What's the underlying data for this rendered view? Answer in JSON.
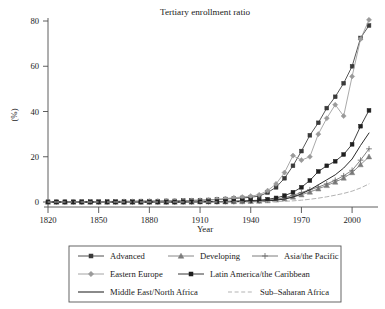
{
  "chart_data": {
    "type": "line",
    "title": "Tertiary enrollment ratio",
    "xlabel": "Year",
    "ylabel": "(%)",
    "xlim": [
      1820,
      2010
    ],
    "ylim": [
      0,
      85
    ],
    "xticks": [
      1820,
      1850,
      1880,
      1910,
      1940,
      1970,
      2000
    ],
    "yticks": [
      0,
      20,
      40,
      60,
      80
    ],
    "grid": false,
    "legend_position": "below-axes",
    "x": [
      1820,
      1825,
      1830,
      1835,
      1840,
      1845,
      1850,
      1855,
      1860,
      1865,
      1870,
      1875,
      1880,
      1885,
      1890,
      1895,
      1900,
      1905,
      1910,
      1915,
      1920,
      1925,
      1930,
      1935,
      1940,
      1945,
      1950,
      1955,
      1960,
      1965,
      1970,
      1975,
      1980,
      1985,
      1990,
      1995,
      2000,
      2005,
      2010
    ],
    "series": [
      {
        "name": "Advanced",
        "color": "#3a3a3a",
        "style": "solid",
        "marker": "square",
        "values": [
          0.1,
          0.1,
          0.1,
          0.1,
          0.2,
          0.2,
          0.2,
          0.2,
          0.3,
          0.3,
          0.3,
          0.4,
          0.4,
          0.4,
          0.5,
          0.5,
          0.6,
          0.7,
          0.8,
          0.9,
          1.1,
          1.3,
          1.6,
          1.8,
          2.1,
          2.6,
          4.2,
          6.5,
          10.5,
          16.0,
          22.5,
          29.5,
          35.0,
          41.5,
          46.5,
          52.5,
          60.0,
          72.5,
          78.0
        ]
      },
      {
        "name": "Developing",
        "color": "#7c7c7c",
        "style": "solid",
        "marker": "triangle",
        "values": [
          0.0,
          0.0,
          0.0,
          0.0,
          0.0,
          0.0,
          0.0,
          0.0,
          0.0,
          0.0,
          0.0,
          0.0,
          0.0,
          0.0,
          0.0,
          0.0,
          0.0,
          0.0,
          0.1,
          0.1,
          0.1,
          0.1,
          0.2,
          0.2,
          0.3,
          0.4,
          0.6,
          0.9,
          1.4,
          2.2,
          3.2,
          4.4,
          5.8,
          7.3,
          8.8,
          10.6,
          13.0,
          16.5,
          20.0
        ]
      },
      {
        "name": "Asia/the Pacific",
        "color": "#6e6e6e",
        "style": "solid",
        "marker": "plus",
        "values": [
          0.0,
          0.0,
          0.0,
          0.0,
          0.0,
          0.0,
          0.0,
          0.0,
          0.0,
          0.0,
          0.0,
          0.0,
          0.0,
          0.0,
          0.0,
          0.0,
          0.0,
          0.0,
          0.1,
          0.1,
          0.1,
          0.2,
          0.2,
          0.3,
          0.4,
          0.5,
          0.8,
          1.2,
          1.9,
          2.9,
          4.2,
          5.4,
          6.6,
          8.0,
          9.6,
          11.6,
          14.0,
          18.5,
          23.5
        ]
      },
      {
        "name": "Eastern Europe",
        "color": "#9a9a9a",
        "style": "solid",
        "marker": "diamond",
        "values": [
          0.1,
          0.1,
          0.1,
          0.1,
          0.1,
          0.2,
          0.2,
          0.2,
          0.2,
          0.3,
          0.3,
          0.3,
          0.4,
          0.4,
          0.5,
          0.5,
          0.6,
          0.7,
          0.8,
          0.9,
          1.2,
          1.5,
          1.9,
          2.2,
          2.6,
          3.2,
          5.0,
          8.0,
          13.0,
          20.5,
          18.5,
          20.0,
          30.0,
          37.0,
          43.0,
          38.0,
          55.5,
          72.0,
          80.5
        ]
      },
      {
        "name": "Latin America/the Caribbean",
        "color": "#1f1f1f",
        "style": "solid",
        "marker": "square",
        "values": [
          0.0,
          0.0,
          0.0,
          0.0,
          0.0,
          0.0,
          0.0,
          0.0,
          0.0,
          0.0,
          0.0,
          0.0,
          0.0,
          0.0,
          0.0,
          0.0,
          0.1,
          0.1,
          0.1,
          0.2,
          0.2,
          0.3,
          0.4,
          0.5,
          0.6,
          0.8,
          1.2,
          1.8,
          2.8,
          4.3,
          6.5,
          9.5,
          13.5,
          16.0,
          18.0,
          21.0,
          25.5,
          33.5,
          40.5
        ]
      },
      {
        "name": "Middle East/North Africa",
        "color": "#2b2b2b",
        "style": "solid",
        "marker": "none",
        "values": [
          0.0,
          0.0,
          0.0,
          0.0,
          0.0,
          0.0,
          0.0,
          0.0,
          0.0,
          0.0,
          0.0,
          0.0,
          0.0,
          0.0,
          0.0,
          0.0,
          0.0,
          0.0,
          0.0,
          0.1,
          0.1,
          0.1,
          0.1,
          0.2,
          0.2,
          0.3,
          0.5,
          0.8,
          1.3,
          2.2,
          3.6,
          5.4,
          7.6,
          9.8,
          12.0,
          15.0,
          19.0,
          25.0,
          30.5
        ]
      },
      {
        "name": "Sub-Saharan Africa",
        "color": "#b3b3b3",
        "style": "dashed",
        "marker": "none",
        "values": [
          0.0,
          0.0,
          0.0,
          0.0,
          0.0,
          0.0,
          0.0,
          0.0,
          0.0,
          0.0,
          0.0,
          0.0,
          0.0,
          0.0,
          0.0,
          0.0,
          0.0,
          0.0,
          0.0,
          0.0,
          0.0,
          0.0,
          0.0,
          0.0,
          0.0,
          0.1,
          0.1,
          0.2,
          0.3,
          0.5,
          0.8,
          1.2,
          1.7,
          2.3,
          3.0,
          3.8,
          4.8,
          6.2,
          8.0
        ]
      }
    ]
  },
  "legend": {
    "rows": [
      [
        "Advanced",
        "Developing",
        "Asia/the Pacific"
      ],
      [
        "Eastern Europe",
        "Latin America/the Caribbean"
      ],
      [
        "Middle East/North Africa",
        "Sub–Saharan Africa"
      ]
    ]
  }
}
